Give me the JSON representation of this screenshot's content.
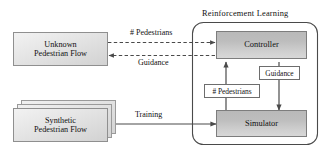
{
  "diagram": {
    "type": "block-flow-diagram",
    "container": {
      "label": "Reinforcement  Learning",
      "shape": "rounded-rectangle"
    },
    "nodes": [
      {
        "id": "unknown-pedestrian-flow",
        "label_line1": "Unknown",
        "label_line2": "Pedestrian Flow",
        "style": "light-gradient-box"
      },
      {
        "id": "synthetic-pedestrian-flow",
        "label_line1": "Synthetic",
        "label_line2": "Pedestrian Flow",
        "style": "stacked-light-gradient-box",
        "stack_count": 3
      },
      {
        "id": "controller",
        "label": "Controller",
        "style": "grey-gradient-box"
      },
      {
        "id": "simulator",
        "label": "Simulator",
        "style": "grey-gradient-box"
      }
    ],
    "edges": [
      {
        "id": "pedestrians-to-controller",
        "label": "# Pedestrians",
        "from": "unknown-pedestrian-flow",
        "to": "controller",
        "style": "dashed",
        "direction": "right"
      },
      {
        "id": "guidance-to-flow",
        "label": "Guidance",
        "from": "controller",
        "to": "unknown-pedestrian-flow",
        "style": "dashed",
        "direction": "left"
      },
      {
        "id": "training-to-simulator",
        "label": "Training",
        "from": "synthetic-pedestrian-flow",
        "to": "simulator",
        "style": "solid",
        "direction": "right"
      },
      {
        "id": "controller-guidance-simulator",
        "label": "Guidance",
        "from": "controller",
        "to": "simulator",
        "style": "solid",
        "direction": "down"
      },
      {
        "id": "simulator-pedestrians-controller",
        "label": "# Pedestrians",
        "from": "simulator",
        "to": "controller",
        "style": "solid",
        "direction": "up"
      }
    ],
    "colors": {
      "background": "#ffffff",
      "stroke": "#4a4a4a",
      "proc_fill_top": "#b9b9b9",
      "proc_fill_bottom": "#d8d8d8",
      "flow_fill_top": "#f2f2f2",
      "flow_fill_bottom": "#d2d2d2",
      "text": "#101010"
    }
  }
}
